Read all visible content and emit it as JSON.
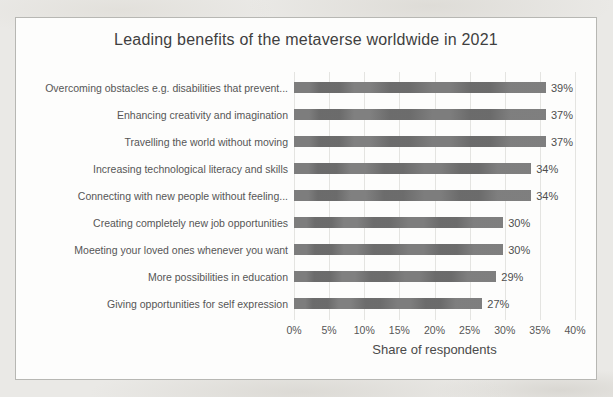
{
  "page": {
    "background_color": "#eae9e6",
    "panel_background": "#fdfdfc",
    "panel_border_color": "#b7b7b3"
  },
  "chart_data": {
    "type": "bar",
    "orientation": "horizontal",
    "title": "Leading benefits of the metaverse worldwide in 2021",
    "categories": [
      "Overcoming obstacles e.g. disabilities that prevent...",
      "Enhancing creativity and imagination",
      "Travelling the world without moving",
      "Increasing technological literacy and skills",
      "Connecting with new people without feeling...",
      "Creating completely new job opportunities",
      "Moeeting your loved ones whenever you want",
      "More possibilities in education",
      "Giving opportunities for self expression"
    ],
    "values": [
      39,
      37,
      37,
      34,
      34,
      30,
      30,
      29,
      27
    ],
    "value_labels": [
      "39%",
      "37%",
      "37%",
      "34%",
      "34%",
      "30%",
      "30%",
      "29%",
      "27%"
    ],
    "xlabel": "Share of respondents",
    "ylabel": "",
    "xlim": [
      0,
      40
    ],
    "x_ticks": [
      "0%",
      "5%",
      "10%",
      "15%",
      "20%",
      "25%",
      "30%",
      "35%",
      "40%"
    ],
    "grid": true,
    "legend": false,
    "bar_color": "#727272",
    "gridline_color": "#e4e4e1",
    "title_color": "#3f3f3f",
    "label_color": "#565656"
  }
}
